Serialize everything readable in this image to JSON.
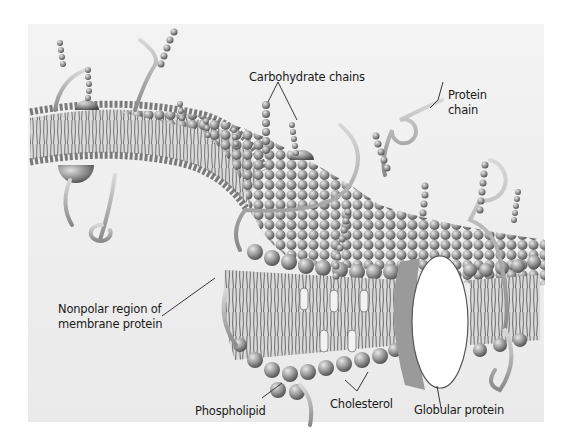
{
  "figure": {
    "background_color": "#eeeeee",
    "labels": {
      "carbohydrate_chains": "Carbohydrate chains",
      "protein_chain_line1": "Protein",
      "protein_chain_line2": "chain",
      "nonpolar_line1": "Nonpolar region of",
      "nonpolar_line2": "membrane protein",
      "phospholipid": "Phospholipid",
      "cholesterol": "Cholesterol",
      "globular_protein": "Globular protein"
    }
  }
}
